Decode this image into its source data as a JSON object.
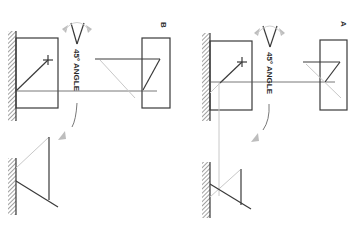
{
  "diagram": {
    "orientation": "rotated 90 degrees clockwise",
    "panels": [
      {
        "id": "B",
        "label": "B",
        "angle_annotation": "45° ANGLE"
      },
      {
        "id": "A",
        "label": "A",
        "angle_annotation": "45° ANGLE"
      }
    ],
    "colors": {
      "ink": "#3a3a3a",
      "faint_line": "#c8c8c8",
      "arrow": "#bdbdbd",
      "background": "#ffffff"
    }
  }
}
